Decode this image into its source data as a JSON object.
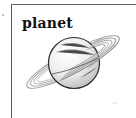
{
  "card": {
    "label": "planet",
    "image": {
      "subject": "saturn-planet-drawing",
      "icon": "planet-with-rings-icon"
    },
    "border_color": "#555555"
  }
}
